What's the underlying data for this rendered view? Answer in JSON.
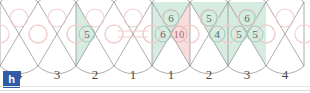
{
  "badge": {
    "label": "h"
  },
  "colors": {
    "green_fill": "#d6ece1",
    "pink_fill": "#f9dcdc",
    "outline": "#8a8a8a",
    "circle_stroke": "#f0cccc",
    "green_text": "#4f6f63",
    "pink_text": "#b06a6a",
    "badge_bg": "#2e5ca8",
    "axis_text": "#4a4a4a"
  },
  "axis": {
    "labels": [
      "4",
      "3",
      "2",
      "1",
      "1",
      "2",
      "3",
      "4"
    ]
  },
  "chart_data": {
    "type": "diagram",
    "title": "",
    "xlabel": "",
    "ylabel": "",
    "cell_count": 8,
    "cells": [
      {
        "index": 0,
        "axis_label": "4",
        "top": null,
        "left": null,
        "right": null,
        "shade": "none"
      },
      {
        "index": 1,
        "axis_label": "3",
        "top": null,
        "left": null,
        "right": null,
        "shade": "none"
      },
      {
        "index": 2,
        "axis_label": "2",
        "top": null,
        "left": "5",
        "right": null,
        "shade": "left-green"
      },
      {
        "index": 3,
        "axis_label": "1",
        "top": null,
        "left": null,
        "right": null,
        "shade": "none"
      },
      {
        "index": 4,
        "axis_label": "1",
        "top": "6",
        "left": "6",
        "right": "10",
        "shade": "top-left-green-right-pink"
      },
      {
        "index": 5,
        "axis_label": "2",
        "top": "5",
        "left": null,
        "right": "4",
        "shade": "top-right-green"
      },
      {
        "index": 6,
        "axis_label": "3",
        "top": "6",
        "left": "5",
        "right": "5",
        "shade": "top-left-right-green"
      },
      {
        "index": 7,
        "axis_label": "4",
        "top": null,
        "left": null,
        "right": null,
        "shade": "none"
      }
    ],
    "values": [
      null,
      null,
      5,
      null,
      6,
      5,
      6,
      null
    ],
    "categories": [
      "4",
      "3",
      "2",
      "1",
      "1",
      "2",
      "3",
      "4"
    ],
    "legend": []
  }
}
